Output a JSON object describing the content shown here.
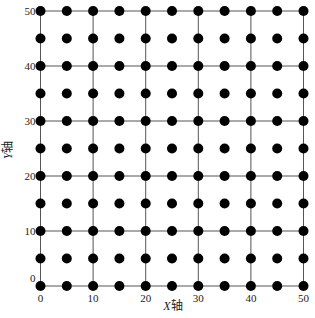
{
  "chart_data": {
    "type": "scatter",
    "title": "",
    "xlabel": "X轴",
    "ylabel": "Y轴",
    "xlim": [
      0,
      50
    ],
    "ylim": [
      0,
      50
    ],
    "grid": true,
    "grid_spacing": 10,
    "x_ticks": [
      0,
      10,
      20,
      30,
      40,
      50
    ],
    "y_ticks": [
      0,
      10,
      20,
      30,
      40,
      50
    ],
    "x_tick_labels": [
      "0",
      "10",
      "20",
      "30",
      "40",
      "50"
    ],
    "y_tick_labels": [
      "0",
      "10",
      "20",
      "30",
      "40",
      "50"
    ],
    "point_spacing": 5,
    "x": [
      0,
      5,
      10,
      15,
      20,
      25,
      30,
      35,
      40,
      45,
      50
    ],
    "y": [
      0,
      5,
      10,
      15,
      20,
      25,
      30,
      35,
      40,
      45,
      50
    ],
    "legend": null,
    "colors": {
      "point": "#000000",
      "grid": "#555555",
      "text": "#222222"
    }
  }
}
